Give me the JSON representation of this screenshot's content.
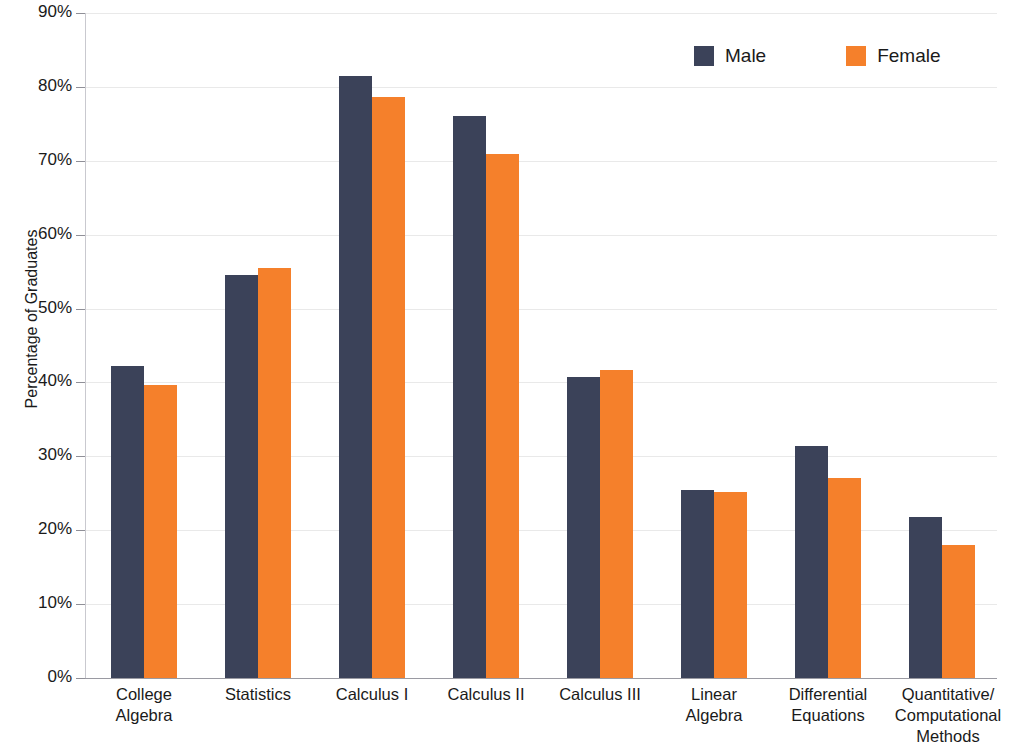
{
  "chart_data": {
    "type": "bar",
    "title": "",
    "subtitle": "",
    "xlabel": "",
    "ylabel": "Percentage of Graduates",
    "ylim": [
      0,
      90
    ],
    "ytick_step": 10,
    "ytick_labels": [
      "0%",
      "10%",
      "20%",
      "30%",
      "40%",
      "50%",
      "60%",
      "70%",
      "80%",
      "90%"
    ],
    "ytick_values": [
      0,
      10,
      20,
      30,
      40,
      50,
      60,
      70,
      80,
      90
    ],
    "grid": true,
    "legend_position": "top-right",
    "categories": [
      "College Algebra",
      "Statistics",
      "Calculus I",
      "Calculus II",
      "Calculus III",
      "Linear Algebra",
      "Differential Equations",
      "Quantitative/Computational Methods"
    ],
    "category_label_lines": [
      [
        "College",
        "Algebra"
      ],
      [
        "Statistics"
      ],
      [
        "Calculus I"
      ],
      [
        "Calculus II"
      ],
      [
        "Calculus III"
      ],
      [
        "Linear",
        "Algebra"
      ],
      [
        "Differential",
        "Equations"
      ],
      [
        "Quantitative/",
        "Computational",
        "Methods"
      ]
    ],
    "series": [
      {
        "name": "Male",
        "color": "#3b4259",
        "values": [
          42.2,
          54.6,
          81.5,
          76.1,
          40.7,
          25.4,
          31.4,
          21.8
        ]
      },
      {
        "name": "Female",
        "color": "#f5802b",
        "values": [
          39.7,
          55.5,
          78.6,
          70.9,
          41.7,
          25.2,
          27.1,
          18.0
        ]
      }
    ]
  },
  "legend": {
    "items": [
      {
        "label": "Male",
        "color": "#3b4259"
      },
      {
        "label": "Female",
        "color": "#f5802b"
      }
    ]
  },
  "colors": {
    "male": "#3b4259",
    "female": "#f5802b",
    "gridline": "#e9e9e9",
    "baseline": "#9a9aa2",
    "text": "#1a1a1a",
    "background": "#ffffff"
  }
}
